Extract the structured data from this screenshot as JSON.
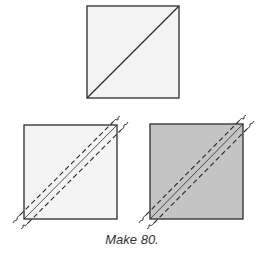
{
  "diagram": {
    "caption": "Make 80.",
    "colors": {
      "outline": "#2b2b2b",
      "light_fabric": "#f4f4f4",
      "dark_fabric": "#c4c4c4",
      "background": "#ffffff"
    },
    "squares": [
      {
        "id": "top-square",
        "fill": "light",
        "marking": "diagonal-line"
      },
      {
        "id": "bottom-left-square",
        "fill": "light",
        "marking": "diagonal-seam-lines"
      },
      {
        "id": "bottom-right-square",
        "fill": "dark",
        "marking": "diagonal-seam-lines"
      }
    ]
  }
}
